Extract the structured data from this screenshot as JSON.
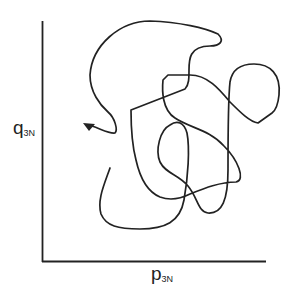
{
  "diagram": {
    "type": "phase-space trajectory",
    "x_axis_label": "p",
    "x_axis_subscript": "3N",
    "y_axis_label": "q",
    "y_axis_subscript": "3N",
    "line_color": "#222222"
  }
}
